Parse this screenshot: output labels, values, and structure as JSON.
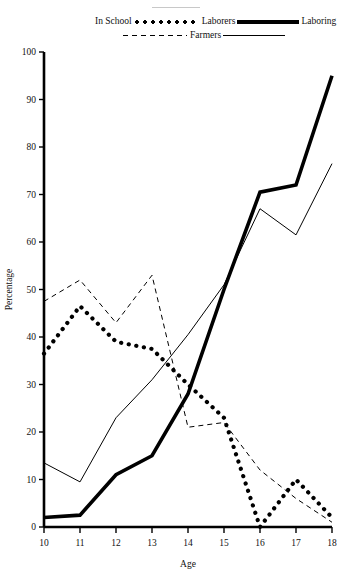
{
  "figure": {
    "top_rule": "decorative-rule"
  },
  "legend": {
    "entries": [
      {
        "label": "In School",
        "style": "thick-dotted",
        "position": "left-of-swatch"
      },
      {
        "label": "Laborers",
        "style": "thick-solid",
        "position": "right-of-swatch"
      },
      {
        "label": "Farmers",
        "style": "dashed",
        "position": "right-of-swatch"
      },
      {
        "label": "Laboring",
        "style": "thin-solid",
        "position": "right-of-swatch"
      }
    ]
  },
  "chart_data": {
    "type": "line",
    "title": "",
    "xlabel": "Age",
    "ylabel": "Percentage",
    "x": [
      10,
      11,
      12,
      13,
      14,
      15,
      16,
      17,
      18
    ],
    "xtick_labels": [
      "10",
      "11",
      "12",
      "13",
      "14",
      "15",
      "16",
      "17",
      "18"
    ],
    "ytick_labels": [
      "0",
      "10",
      "20",
      "30",
      "40",
      "50",
      "60",
      "70",
      "80",
      "90",
      "100"
    ],
    "yticks": [
      0,
      10,
      20,
      30,
      40,
      50,
      60,
      70,
      80,
      90,
      100
    ],
    "xlim": [
      10,
      18
    ],
    "ylim": [
      0,
      100
    ],
    "grid": false,
    "legend_position": "top",
    "series": [
      {
        "name": "In School",
        "style": "thick-dotted",
        "color": "#000000",
        "values": [
          36.5,
          46.5,
          39,
          37.5,
          30,
          23,
          0,
          10,
          2
        ]
      },
      {
        "name": "Laborers",
        "style": "thick-solid",
        "color": "#000000",
        "values": [
          2,
          2.5,
          11,
          15,
          28,
          50,
          70.5,
          72,
          95
        ]
      },
      {
        "name": "Farmers",
        "style": "dashed",
        "color": "#000000",
        "values": [
          47.5,
          52,
          43,
          53,
          21,
          22,
          12,
          6,
          1
        ]
      },
      {
        "name": "Laboring",
        "style": "thin-solid",
        "color": "#000000",
        "values": [
          13.5,
          9.5,
          23,
          31,
          40.5,
          51,
          67,
          61.5,
          76.5
        ]
      }
    ]
  }
}
